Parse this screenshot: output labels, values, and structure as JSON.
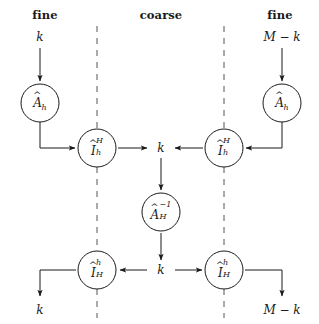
{
  "diagram": {
    "colors": {
      "stroke": "#1a1a1a",
      "background": "#ffffff",
      "dashed": "#555555"
    },
    "columns": [
      {
        "id": "left",
        "header": "fine",
        "input": "k",
        "output": "k"
      },
      {
        "id": "center",
        "header": "coarse"
      },
      {
        "id": "right",
        "header": "fine",
        "input": "M − k",
        "output": "M − k"
      }
    ],
    "headers": {
      "left": "fine",
      "center": "coarse",
      "right": "fine"
    },
    "inputs": {
      "left": "k",
      "right": "M − k"
    },
    "outputs": {
      "left": "k",
      "right": "M − k"
    },
    "center_labels": {
      "top": "k",
      "bottom": "k"
    },
    "nodes": [
      {
        "id": "A-hat-h-left",
        "base": "A",
        "hat": true,
        "sub": "h",
        "sup": "",
        "cx": 40,
        "cy": 103
      },
      {
        "id": "I-hat-h-H-left",
        "base": "I",
        "hat": true,
        "sub": "h",
        "sup": "H",
        "cx": 97,
        "cy": 148
      },
      {
        "id": "A-hat-H-inv",
        "base": "A",
        "hat": true,
        "sub": "H",
        "sup": "−1",
        "cx": 161,
        "cy": 212
      },
      {
        "id": "I-hat-H-h-left",
        "base": "I",
        "hat": true,
        "sub": "H",
        "sup": "h",
        "cx": 97,
        "cy": 270
      },
      {
        "id": "I-hat-H-h-right",
        "base": "I",
        "hat": true,
        "sub": "H",
        "sup": "h",
        "cx": 224,
        "cy": 270
      },
      {
        "id": "I-hat-h-H-right",
        "base": "I",
        "hat": true,
        "sub": "h",
        "sup": "H",
        "cx": 224,
        "cy": 148
      },
      {
        "id": "A-hat-h-right",
        "base": "A",
        "hat": true,
        "sub": "h",
        "sup": "",
        "cx": 282,
        "cy": 103
      }
    ],
    "node_radius": 19,
    "dashed_lines": [
      {
        "x": 97,
        "y1": 22,
        "y2": 318
      },
      {
        "x": 224,
        "y1": 22,
        "y2": 318
      }
    ]
  }
}
